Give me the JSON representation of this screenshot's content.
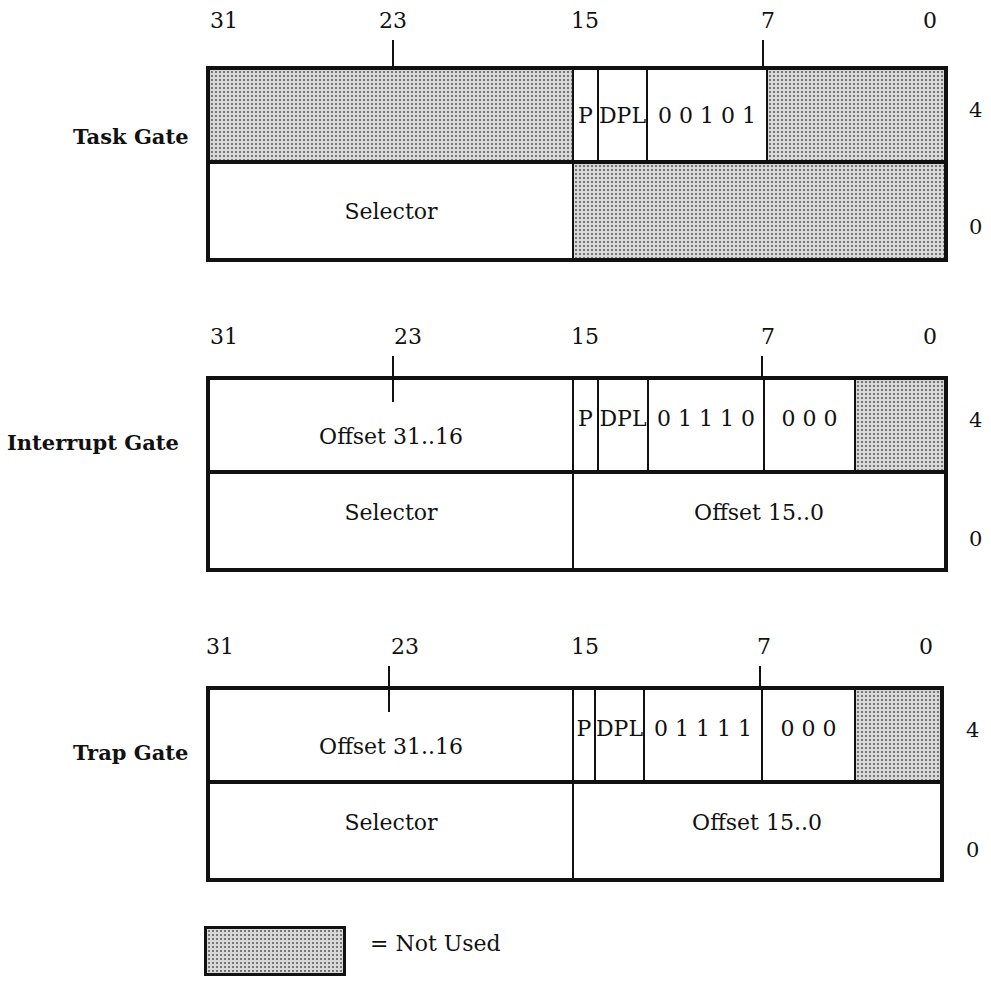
{
  "bit_positions": [
    "31",
    "23",
    "15",
    "7",
    "0"
  ],
  "gates": [
    {
      "name": "Task Gate",
      "upper_dword": {
        "offset_label": "4",
        "fields": [
          {
            "label": "",
            "unused": true
          },
          {
            "label": "P"
          },
          {
            "label": "DPL"
          },
          {
            "label": "0 0 1 0 1"
          },
          {
            "label": "",
            "unused": true
          }
        ]
      },
      "lower_dword": {
        "offset_label": "0",
        "fields": [
          {
            "label": "Selector"
          },
          {
            "label": "",
            "unused": true
          }
        ]
      }
    },
    {
      "name": "Interrupt Gate",
      "upper_dword": {
        "offset_label": "4",
        "fields": [
          {
            "label": "Offset  31..16"
          },
          {
            "label": "P"
          },
          {
            "label": "DPL"
          },
          {
            "label": "0 1 1 1 0"
          },
          {
            "label": "0 0 0"
          },
          {
            "label": "",
            "unused": true
          }
        ]
      },
      "lower_dword": {
        "offset_label": "0",
        "fields": [
          {
            "label": "Selector"
          },
          {
            "label": "Offset  15..0"
          }
        ]
      }
    },
    {
      "name": "Trap Gate",
      "upper_dword": {
        "offset_label": "4",
        "fields": [
          {
            "label": "Offset  31..16"
          },
          {
            "label": "P"
          },
          {
            "label": "DPL"
          },
          {
            "label": "0 1 1 1 1"
          },
          {
            "label": "0 0 0"
          },
          {
            "label": "",
            "unused": true
          }
        ]
      },
      "lower_dword": {
        "offset_label": "0",
        "fields": [
          {
            "label": "Selector"
          },
          {
            "label": "Offset  15..0"
          }
        ]
      }
    }
  ],
  "legend": {
    "label": "= Not Used",
    "shade_color": "#d8d8d8"
  }
}
